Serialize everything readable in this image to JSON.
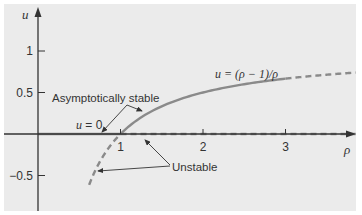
{
  "chart_data": {
    "type": "line",
    "title": "",
    "xlabel": "ρ",
    "ylabel": "u",
    "xlim": [
      -0.45,
      3.85
    ],
    "ylim": [
      -0.92,
      1.55
    ],
    "x_ticks": [
      {
        "value": 1,
        "label": "1"
      },
      {
        "value": 2,
        "label": "2"
      },
      {
        "value": 3,
        "label": "3"
      }
    ],
    "y_ticks": [
      {
        "value": 1,
        "label": "1"
      },
      {
        "value": 0.5,
        "label": "0.5"
      },
      {
        "value": -0.5,
        "label": "−0.5"
      }
    ],
    "series": [
      {
        "name": "u = 0 (stable)",
        "function": "u = 0",
        "x_range": [
          0,
          1
        ],
        "style": "solid"
      },
      {
        "name": "u = 0 (unstable)",
        "function": "u = 0",
        "x_range": [
          1,
          3.85
        ],
        "style": "dashed"
      },
      {
        "name": "u = (ρ − 1)/ρ (stable)",
        "function": "u = (rho - 1)/rho",
        "x_range": [
          1,
          3.0
        ],
        "style": "solid"
      },
      {
        "name": "u = (ρ − 1)/ρ (unstable, ρ>3)",
        "function": "u = (rho - 1)/rho",
        "x_range": [
          3.0,
          3.85
        ],
        "style": "dashed"
      },
      {
        "name": "u = (ρ − 1)/ρ (unstable, ρ<1)",
        "function": "u = (rho - 1)/rho",
        "x_range": [
          0.62,
          1
        ],
        "style": "dashed"
      }
    ],
    "annotations": [
      {
        "text": "u = 0",
        "kind": "curve-label"
      },
      {
        "text": "u = (ρ − 1)/ρ",
        "kind": "curve-label"
      },
      {
        "text": "Asymptotically stable",
        "kind": "callout",
        "points_to": [
          "u = 0 for 0<ρ<1",
          "u = (ρ−1)/ρ for ρ>1"
        ]
      },
      {
        "text": "Unstable",
        "kind": "callout",
        "points_to": [
          "u = 0 for ρ>1",
          "u = (ρ−1)/ρ for ρ<1"
        ]
      }
    ],
    "grid": false
  },
  "labels": {
    "u_axis": "u",
    "rho_axis": "ρ",
    "u_zero": "u = 0",
    "curve": "u = (ρ − 1)/ρ",
    "stable": "Asymptotically stable",
    "unstable": "Unstable"
  },
  "colors": {
    "background": "#ebebeb",
    "axis": "#333333",
    "curve": "#8a8a8a",
    "text": "#333333"
  }
}
